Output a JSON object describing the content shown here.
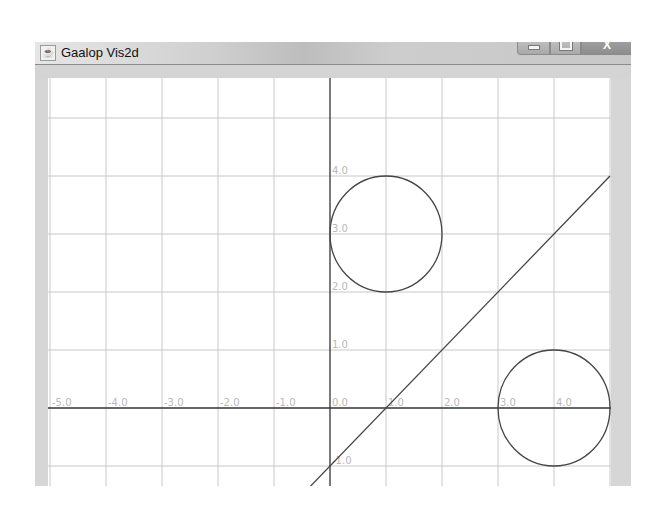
{
  "window": {
    "title": "Gaalop Vis2d",
    "icon": "java-cup-icon",
    "controls": {
      "minimize": "minimize-icon",
      "maximize": "maximize-icon",
      "close_label": "X"
    }
  },
  "colors": {
    "grid": "#c8c8c8",
    "axes": "#333333",
    "shapes": "#444444",
    "labels": "#b9b9b9",
    "frame": "#d6d6d6"
  },
  "chart_data": {
    "type": "scatter",
    "title": "",
    "xlabel": "",
    "ylabel": "",
    "xlim": [
      -5.0,
      5.0
    ],
    "ylim": [
      -2.0,
      5.0
    ],
    "grid": true,
    "x_tick_labels": [
      "-5.0",
      "-4.0",
      "-3.0",
      "-2.0",
      "-1.0",
      "0.0",
      "1.0",
      "2.0",
      "3.0",
      "4.0"
    ],
    "y_tick_labels": [
      "4.0",
      "3.0",
      "2.0",
      "1.0",
      "0.0",
      "-1.0",
      "-2.0"
    ],
    "shapes": [
      {
        "kind": "circle",
        "center": [
          1.0,
          3.0
        ],
        "radius": 1.0
      },
      {
        "kind": "circle",
        "center": [
          4.0,
          0.0
        ],
        "radius": 1.0
      },
      {
        "kind": "line",
        "equation": "y = x - 1",
        "from": [
          -1.0,
          -2.0
        ],
        "to": [
          5.0,
          4.0
        ]
      }
    ]
  }
}
